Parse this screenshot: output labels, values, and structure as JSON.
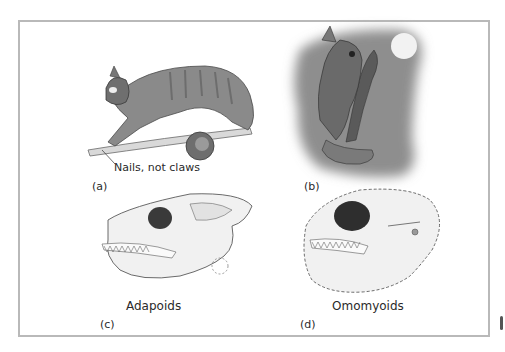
{
  "figure": {
    "panels": [
      {
        "id": "a",
        "label": "(a)",
        "annotation": "Nails, not claws",
        "subject": "arboreal primate walking on branch",
        "background": "#ffffff"
      },
      {
        "id": "b",
        "label": "(b)",
        "subject": "nocturnal primate clinging to tree under moon",
        "background": "#8e8e8e",
        "moon_color": "#f2f2f2"
      },
      {
        "id": "c",
        "label": "(c)",
        "caption": "Adapoids",
        "subject": "adapoid skull"
      },
      {
        "id": "d",
        "label": "(d)",
        "caption": "Omomyoids",
        "subject": "omomyoid skull"
      }
    ],
    "colors": {
      "frame_border": "#b9b9b9",
      "text": "#2a2a2a",
      "ink": "#4a4a4a"
    }
  }
}
